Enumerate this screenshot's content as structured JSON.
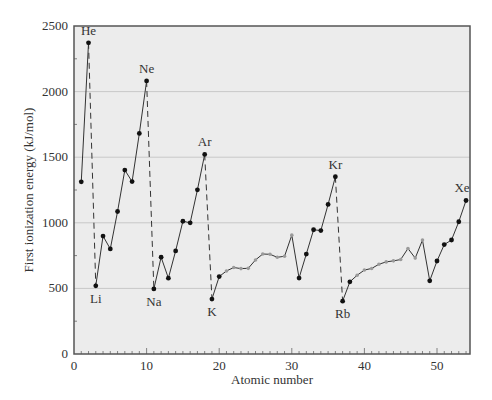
{
  "chart_data": {
    "type": "line",
    "title": "",
    "xlabel": "Atomic number",
    "ylabel": "First ionization energy (kJ/mol)",
    "xlim": [
      0,
      54
    ],
    "ylim": [
      0,
      2500
    ],
    "grid": {
      "y": true,
      "x": false,
      "y_lines": [
        500,
        1000,
        1500,
        2000
      ]
    },
    "x_ticks": [
      0,
      10,
      20,
      30,
      40,
      50
    ],
    "y_ticks": [
      0,
      500,
      1000,
      1500,
      2000,
      2500
    ],
    "x_tick_labels": [
      "0",
      "10",
      "20",
      "30",
      "40",
      "50"
    ],
    "y_tick_labels": [
      "0",
      "500",
      "1000",
      "1500",
      "2000",
      "2500"
    ],
    "legend": null,
    "series": [
      {
        "name": "First ionization energy",
        "x": [
          1,
          2,
          3,
          4,
          5,
          6,
          7,
          8,
          9,
          10,
          11,
          12,
          13,
          14,
          15,
          16,
          17,
          18,
          19,
          20,
          21,
          22,
          23,
          24,
          25,
          26,
          27,
          28,
          29,
          30,
          31,
          32,
          33,
          34,
          35,
          36,
          37,
          38,
          39,
          40,
          41,
          42,
          43,
          44,
          45,
          46,
          47,
          48,
          49,
          50,
          51,
          52,
          53,
          54
        ],
        "values": [
          1312,
          2372,
          520,
          899,
          801,
          1086,
          1402,
          1314,
          1681,
          2081,
          496,
          738,
          578,
          786,
          1012,
          1000,
          1251,
          1521,
          419,
          590,
          633,
          659,
          651,
          653,
          717,
          762,
          760,
          737,
          745,
          906,
          579,
          762,
          947,
          941,
          1140,
          1351,
          403,
          550,
          600,
          640,
          652,
          684,
          702,
          710,
          720,
          804,
          731,
          868,
          558,
          709,
          834,
          869,
          1008,
          1170
        ],
        "transition_metal_ranges": [
          [
            21,
            30
          ],
          [
            39,
            48
          ]
        ]
      }
    ],
    "annotations": [
      {
        "label": "He",
        "z": 2,
        "position": "above"
      },
      {
        "label": "Ne",
        "z": 10,
        "position": "above"
      },
      {
        "label": "Ar",
        "z": 18,
        "position": "above"
      },
      {
        "label": "Kr",
        "z": 36,
        "position": "above"
      },
      {
        "label": "Xe",
        "z": 54,
        "position": "above"
      },
      {
        "label": "Li",
        "z": 3,
        "position": "below"
      },
      {
        "label": "Na",
        "z": 11,
        "position": "below"
      },
      {
        "label": "K",
        "z": 19,
        "position": "below"
      },
      {
        "label": "Rb",
        "z": 37,
        "position": "below"
      }
    ],
    "dashed_drops": [
      [
        2,
        3
      ],
      [
        10,
        11
      ],
      [
        18,
        19
      ],
      [
        36,
        37
      ]
    ]
  },
  "colors": {
    "plot_bg": "#ececec",
    "grid": "#c8c8c8",
    "line": "#333333",
    "main_marker": "#111111",
    "transition_marker": "#9a9a9a",
    "axis": "#555555",
    "text": "#333333"
  }
}
